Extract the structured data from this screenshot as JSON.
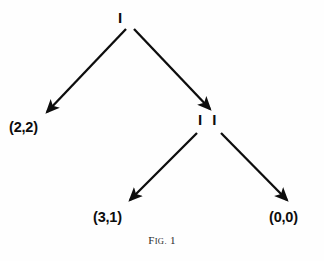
{
  "figure": {
    "caption_prefix": "F",
    "caption_small": "IG.",
    "caption_number": "1",
    "caption_full": "Fig. 1",
    "background_color": "#fefefe",
    "ink_color": "#0d0d0d",
    "width": 324,
    "height": 261
  },
  "diagram": {
    "type": "game-tree",
    "nodes": [
      {
        "id": "player-1",
        "label": "I",
        "kind": "decision-node",
        "x": 124,
        "y": 19
      },
      {
        "id": "player-2",
        "label": "I I",
        "kind": "decision-node",
        "x": 209,
        "y": 121
      },
      {
        "id": "terminal-left",
        "label": "(2,2)",
        "kind": "payoff",
        "x": 32,
        "y": 128
      },
      {
        "id": "terminal-mid",
        "label": "(3,1)",
        "kind": "payoff",
        "x": 116,
        "y": 218
      },
      {
        "id": "terminal-right",
        "label": "(0,0)",
        "kind": "payoff",
        "x": 292,
        "y": 218
      }
    ],
    "edges": [
      {
        "id": "edge-1-left",
        "from": "player-1",
        "to": "terminal-left",
        "x1": 126,
        "y1": 29,
        "x2": 46,
        "y2": 113
      },
      {
        "id": "edge-1-right",
        "from": "player-1",
        "to": "player-2",
        "x1": 134,
        "y1": 29,
        "x2": 211,
        "y2": 110
      },
      {
        "id": "edge-2-left",
        "from": "player-2",
        "to": "terminal-mid",
        "x1": 197,
        "y1": 133,
        "x2": 129,
        "y2": 201
      },
      {
        "id": "edge-2-right",
        "from": "player-2",
        "to": "terminal-right",
        "x1": 221,
        "y1": 133,
        "x2": 288,
        "y2": 201
      }
    ]
  }
}
